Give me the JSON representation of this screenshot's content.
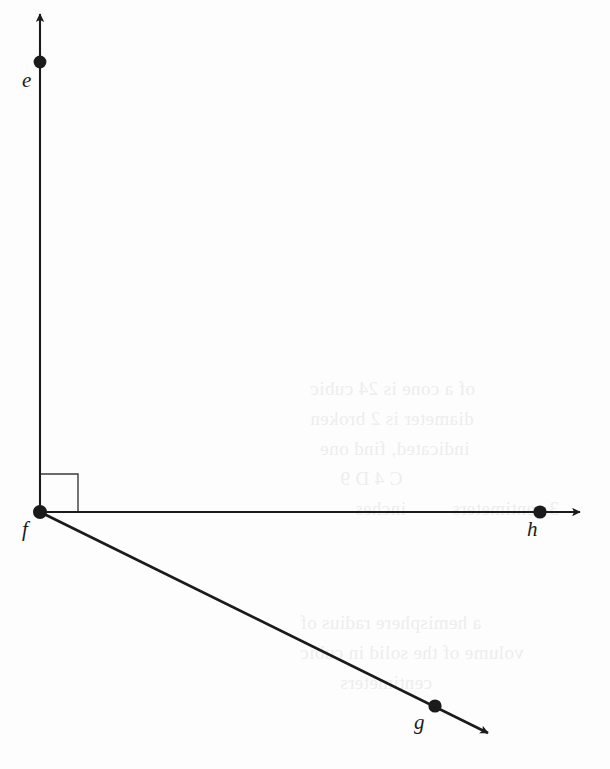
{
  "figure": {
    "background_color": "#fdfdfd",
    "ink_color": "#1b1b1b",
    "ghost_color": "#ededed"
  },
  "points": [
    {
      "id": "e",
      "label": "e",
      "x": 40,
      "y": 62,
      "label_x": 22,
      "label_y": 70
    },
    {
      "id": "f",
      "label": "f",
      "x": 40,
      "y": 512,
      "label_x": 22,
      "label_y": 519
    },
    {
      "id": "g",
      "label": "g",
      "x": 435,
      "y": 706,
      "label_x": 414,
      "label_y": 712
    },
    {
      "id": "h",
      "label": "h",
      "x": 540,
      "y": 512,
      "label_x": 527,
      "label_y": 519
    }
  ],
  "rays": [
    {
      "id": "ray-fe",
      "from": "f",
      "through": "e",
      "origin_x": 40,
      "origin_y": 512,
      "tip_x": 40,
      "tip_y": 3,
      "direction": "up"
    },
    {
      "id": "ray-fh",
      "from": "f",
      "through": "h",
      "origin_x": 40,
      "origin_y": 512,
      "tip_x": 592,
      "tip_y": 512,
      "direction": "right"
    },
    {
      "id": "ray-fg",
      "from": "f",
      "through": "g",
      "origin_x": 40,
      "origin_y": 512,
      "tip_x": 497,
      "tip_y": 738,
      "direction": "down-right"
    }
  ],
  "markers": {
    "right_angle": {
      "id": "right-angle-marker",
      "vertex": "f",
      "between": [
        "ray-fe",
        "ray-fh"
      ],
      "size": 38,
      "x": 40,
      "y": 512
    }
  },
  "ghost_text": [
    {
      "text": "of a cone is 24 cubic",
      "x": 310,
      "y": 378
    },
    {
      "text": "diameter is 2 broken",
      "x": 310,
      "y": 408
    },
    {
      "text": "indicated, find one",
      "x": 320,
      "y": 438
    },
    {
      "text": "C  4  D  9",
      "x": 340,
      "y": 468
    },
    {
      "text": "inches",
      "x": 355,
      "y": 498
    },
    {
      "text": "3 centimeters",
      "x": 452,
      "y": 498
    },
    {
      "text": "a hemisphere radius of",
      "x": 300,
      "y": 612
    },
    {
      "text": "volume of the solid in cubic",
      "x": 300,
      "y": 642
    },
    {
      "text": "centimeters",
      "x": 340,
      "y": 672
    }
  ]
}
